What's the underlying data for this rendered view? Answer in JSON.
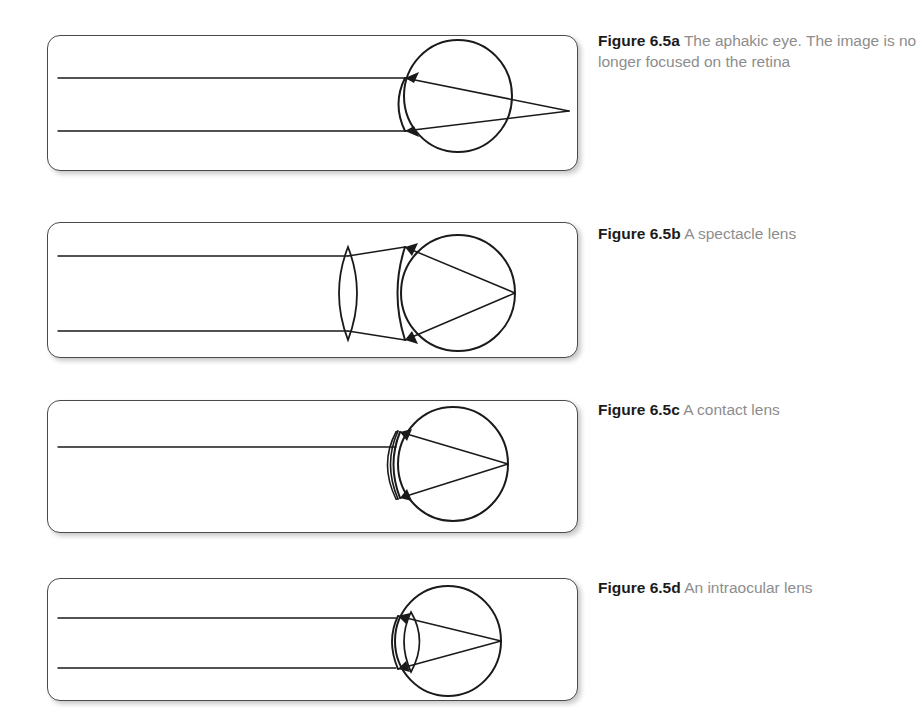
{
  "figure": {
    "background": "#ffffff",
    "stroke_color": "#1a1a1a",
    "panel_border_color": "#4a4a4a",
    "caption_label_color": "#1b1b1b",
    "caption_text_color": "#8d8d8d"
  },
  "panels": [
    {
      "id": "a",
      "caption_label": "Figure 6.5a",
      "caption_text": "The aphakic eye. The image is no longer focused on the retina",
      "description": "Aphakic eye: two parallel incident light rays enter the cornea and converge to a focal point behind the eyeball, past the retina.",
      "has_correcting_lens": false,
      "correcting_lens_type": "none",
      "focus_location": "behind the retina",
      "ray_count": 2
    },
    {
      "id": "b",
      "caption_label": "Figure 6.5b",
      "caption_text": "A spectacle lens",
      "description": "A biconvex spectacle lens sits well in front of the eye; it converges the parallel rays so they focus on the retina.",
      "has_correcting_lens": true,
      "correcting_lens_type": "biconvex spectacle lens",
      "focus_location": "on the retina",
      "ray_count": 2
    },
    {
      "id": "c",
      "caption_label": "Figure 6.5c",
      "caption_text": "A contact lens",
      "description": "A thin meniscus contact lens rests directly on the cornea; rays focus on the retina.",
      "has_correcting_lens": true,
      "correcting_lens_type": "contact lens",
      "focus_location": "on the retina",
      "ray_count": 2
    },
    {
      "id": "d",
      "caption_label": "Figure 6.5d",
      "caption_text": "An intraocular lens",
      "description": "A small biconvex intraocular lens is implanted inside the eye behind the cornea; rays focus on the retina.",
      "has_correcting_lens": true,
      "correcting_lens_type": "intraocular lens",
      "focus_location": "on the retina",
      "ray_count": 2
    }
  ]
}
